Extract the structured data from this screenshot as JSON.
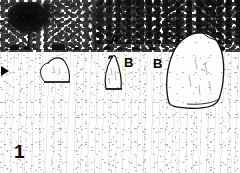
{
  "figure": {
    "number": "1",
    "caption_visible": false,
    "medium": "black-and-white halftone photograph (photocopied / scanned)"
  },
  "labels": [
    {
      "id": "label-a",
      "text": "A",
      "x": 110,
      "y": 33,
      "target": "low stones on the horizon line"
    },
    {
      "id": "label-b1",
      "text": "B",
      "x": 124,
      "y": 56,
      "target": "middle pointed standing stone"
    },
    {
      "id": "label-b2",
      "text": "B",
      "x": 153,
      "y": 57,
      "target": "large right-hand boulder"
    }
  ],
  "markers": {
    "edge_arrow": {
      "name": "edge-arrow-marker",
      "x": 1,
      "y": 66,
      "direction": "right"
    }
  },
  "scene": {
    "horizon_y": 49,
    "sky_visible": false,
    "stones": [
      {
        "name": "stone-left",
        "shape": "rounded dome / low boulder",
        "x": 40,
        "y": 56,
        "w": 32,
        "h": 26
      },
      {
        "name": "stone-middle",
        "shape": "pointed upright menhir",
        "x": 102,
        "y": 54,
        "w": 22,
        "h": 36
      },
      {
        "name": "stone-right",
        "shape": "large angular boulder",
        "x": 163,
        "y": 31,
        "w": 62,
        "h": 76
      }
    ],
    "trees": [
      {
        "name": "tree-left",
        "x": 8,
        "y": 2,
        "w": 52,
        "h": 44,
        "tone": "very dark dense crown"
      },
      {
        "name": "tree-mid",
        "x": 78,
        "y": 4,
        "w": 40,
        "h": 46,
        "tone": "light sparse crown with visible trunk"
      }
    ]
  },
  "colors": {
    "ink": "#000000",
    "paper": "#ffffff",
    "foliage_dark": "#101010",
    "grass_speckle": "#9a9a9a",
    "outline": "#1a1a1a"
  }
}
